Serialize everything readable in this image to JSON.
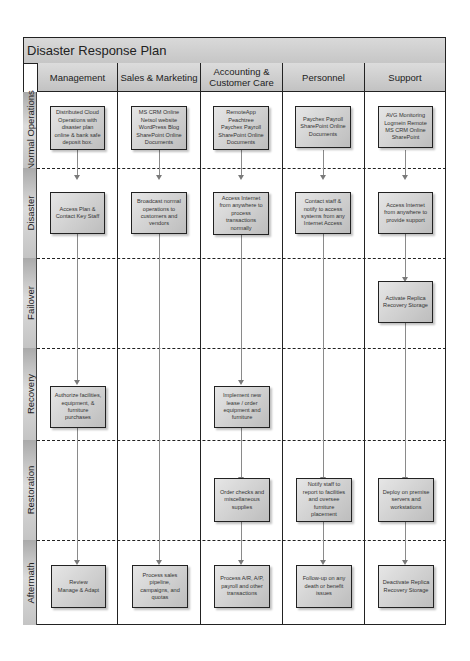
{
  "diagram": {
    "title": "Disaster Response Plan",
    "columns": [
      {
        "id": "management",
        "label": "Management"
      },
      {
        "id": "sales",
        "label": "Sales & Marketing"
      },
      {
        "id": "accounting",
        "label": "Accounting &\nCustomer Care"
      },
      {
        "id": "personnel",
        "label": "Personnel"
      },
      {
        "id": "support",
        "label": "Support"
      }
    ],
    "rows": [
      {
        "id": "normal",
        "label": "Normal Operations"
      },
      {
        "id": "disaster",
        "label": "Disaster"
      },
      {
        "id": "failover",
        "label": "Failover"
      },
      {
        "id": "recovery",
        "label": "Recovery"
      },
      {
        "id": "restoration",
        "label": "Restoration"
      },
      {
        "id": "aftermath",
        "label": "Aftermath"
      }
    ],
    "boxes": {
      "normal": {
        "management": "Distributed Cloud\nOperations with\ndisaster plan\nonline & bank safe\ndeposit box.",
        "sales": "MS CRM Online\nNetsol website\nWordPress Blog\nSharePoint Online\nDocuments",
        "accounting": "RemoteApp\nPeachtree\nPaychex Payroll\nSharePoint Online\nDocuments",
        "personnel": "Paychex Payroll\nSharePoint Online\nDocuments",
        "support": "AVG Monitoring\nLogmein Remote\nMS CRM Online\nSharePoint"
      },
      "disaster": {
        "management": "Access Plan &\nContact Key Staff",
        "sales": "Broadcast normal\noperations to\ncustomers and\nvendors",
        "accounting": "Access Internet\nfrom anywhere to\nprocess\ntransactions\nnormally",
        "personnel": "Contact staff &\nnotify to access\nsystems from any\nInternet Access",
        "support": "Access Internet\nfrom anywhere to\nprovide support"
      },
      "failover": {
        "support": "Activate Replica\nRecovery Storage"
      },
      "recovery": {
        "management": "Authorize facilities,\nequipment, &\nfurniture\npurchases",
        "accounting": "Implement new\nlease / order\nequipment and\nfurniture"
      },
      "restoration": {
        "accounting": "Order checks and\nmiscellaneous\nsupplies",
        "personnel": "Notify staff to\nreport to facilities\nand oversee\nfurniture\nplacement",
        "support": "Deploy on premise\nservers and\nworkstations"
      },
      "aftermath": {
        "management": "Review\nManage & Adapt",
        "sales": "Process sales\npipeline,\ncampaigns, and\nquotas",
        "accounting": "Process A/R, A/P,\npayroll and other\ntransactions",
        "personnel": "Follow-up on any\ndeath or benefit\nissues",
        "support": "Deactivate Replica\nRecovery Storage"
      }
    },
    "colors": {
      "border": "#222222",
      "header_fill": "#c6c6c6",
      "box_fill": "#d0d0d0",
      "connector": "#8a8a8a"
    }
  }
}
